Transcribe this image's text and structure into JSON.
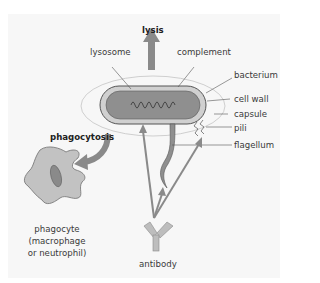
{
  "diagram": {
    "labels": {
      "lysis": "lysis",
      "lysosome": "lysosome",
      "complement": "complement",
      "bacterium": "bacterium",
      "cell_wall": "cell wall",
      "capsule": "capsule",
      "pili": "pili",
      "flagellum": "flagellum",
      "phagocytosis": "phagocytosis",
      "phagocyte_line1": "phagocyte",
      "phagocyte_line2": "(macrophage",
      "phagocyte_line3": "or neutrophil)",
      "antibody": "antibody"
    },
    "colors": {
      "panel": "#f7f7f7",
      "arrow": "#8a8a8a",
      "bacterium_body": "#8f8f8f",
      "cell_wall": "#c9c9c9",
      "phagocyte": "#c2c2c2",
      "nucleus": "#8a8a8a",
      "capsule_line": "#bdbdbd"
    }
  }
}
